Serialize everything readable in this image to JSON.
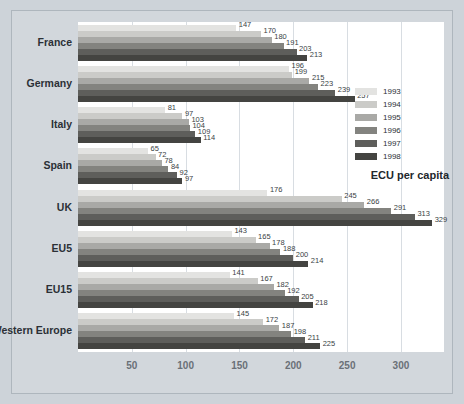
{
  "chart_data": {
    "type": "bar",
    "orientation": "horizontal",
    "title": "",
    "xlabel": "",
    "ylabel": "",
    "legend_title": "ECU per capita",
    "legend_position": "right",
    "grid": true,
    "xlim": [
      0,
      340
    ],
    "xticks": [
      50,
      100,
      150,
      200,
      250,
      300
    ],
    "categories": [
      "France",
      "Germany",
      "Italy",
      "Spain",
      "UK",
      "EU5",
      "EU15",
      "Western Europe"
    ],
    "series": [
      {
        "name": "1993",
        "color": "#e3e3e1",
        "values": [
          147,
          196,
          81,
          65,
          176,
          143,
          141,
          145
        ]
      },
      {
        "name": "1994",
        "color": "#cbcbc8",
        "values": [
          170,
          199,
          97,
          72,
          245,
          165,
          167,
          172
        ]
      },
      {
        "name": "1995",
        "color": "#a9a9a6",
        "values": [
          180,
          215,
          103,
          78,
          266,
          178,
          182,
          187
        ]
      },
      {
        "name": "1996",
        "color": "#83837f",
        "values": [
          191,
          223,
          104,
          84,
          291,
          188,
          192,
          198
        ]
      },
      {
        "name": "1997",
        "color": "#5e5e5b",
        "values": [
          203,
          239,
          109,
          92,
          313,
          200,
          205,
          211
        ]
      },
      {
        "name": "1998",
        "color": "#444441",
        "values": [
          213,
          257,
          114,
          97,
          329,
          214,
          218,
          225
        ]
      }
    ]
  },
  "axis": {
    "tick_labels": [
      "50",
      "100",
      "150",
      "200",
      "250",
      "300"
    ]
  }
}
